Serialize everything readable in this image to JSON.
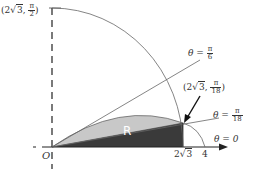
{
  "diagram": {
    "origin_label": "O",
    "region_label": "R",
    "axis_ticks": {
      "two_root3": "2√3",
      "four": "4",
      "two": "2",
      "root3": "3"
    },
    "rays": [
      {
        "name": "theta-pi-over-6",
        "theta": "θ",
        "eq": "=",
        "num": "π",
        "den": "6"
      },
      {
        "name": "theta-pi-over-18",
        "theta": "θ",
        "eq": "=",
        "num": "π",
        "den": "18"
      },
      {
        "name": "theta-zero",
        "text": "θ = 0"
      }
    ],
    "points": [
      {
        "name": "point-2root3-pi-over-2",
        "open": "(",
        "two": "2",
        "root": "3",
        "comma": ",",
        "num": "π",
        "den": "2",
        "close": ")"
      },
      {
        "name": "point-2root3-pi-over-18",
        "open": "(",
        "two": "2",
        "root": "3",
        "comma": ",",
        "num": "π",
        "den": "18",
        "close": ")"
      }
    ],
    "colors": {
      "stroke": "#555555",
      "light_region": "#c8c8c8",
      "dark_region": "#3a3a3a",
      "axis": "#222222"
    }
  }
}
